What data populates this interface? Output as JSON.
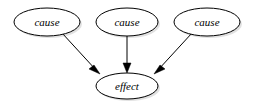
{
  "diagram": {
    "type": "causal-diagram",
    "title": "",
    "background_color": "#ffffff",
    "node_fill_color": "#ffffff",
    "node_stroke_color": "#000000",
    "edge_color": "#000000",
    "shadow_color": "#c8c8c8",
    "nodes": [
      {
        "id": "cause1",
        "label": "cause",
        "shape": "ellipse",
        "cx": 47,
        "cy": 22,
        "rx": 33,
        "ry": 14
      },
      {
        "id": "cause2",
        "label": "cause",
        "shape": "ellipse",
        "cx": 127,
        "cy": 22,
        "rx": 31,
        "ry": 14
      },
      {
        "id": "cause3",
        "label": "cause",
        "shape": "ellipse",
        "cx": 207,
        "cy": 22,
        "rx": 33,
        "ry": 14
      },
      {
        "id": "effect",
        "label": "effect",
        "shape": "ellipse",
        "cx": 127,
        "cy": 86,
        "rx": 31,
        "ry": 13
      }
    ],
    "edges": [
      {
        "id": "edge-cause1-effect",
        "from": "cause1",
        "to": "effect",
        "label": "",
        "arrow": "to",
        "x1": 62,
        "y1": 33,
        "x2": 100,
        "y2": 74
      },
      {
        "id": "edge-cause2-effect",
        "from": "cause2",
        "to": "effect",
        "label": "",
        "arrow": "to",
        "x1": 127,
        "y1": 36,
        "x2": 127,
        "y2": 72
      },
      {
        "id": "edge-cause3-effect",
        "from": "cause3",
        "to": "effect",
        "label": "",
        "arrow": "to",
        "x1": 192,
        "y1": 33,
        "x2": 154,
        "y2": 74
      }
    ]
  }
}
